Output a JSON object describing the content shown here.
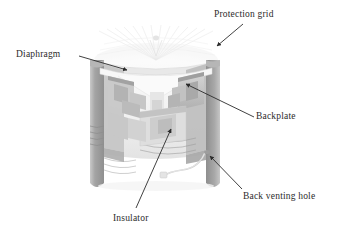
{
  "figure": {
    "kind": "cutaway-illustration",
    "background_color": "#ffffff",
    "line_color": "#2b2b2b",
    "body_gray_dark": "#9a9a9a",
    "body_gray_mid": "#bcbcbc",
    "body_gray_light": "#dcdcdc",
    "body_gray_pale": "#efefef"
  },
  "labels": {
    "protection_grid": "Protection grid",
    "diaphragm": "Diaphragm",
    "backplate": "Backplate",
    "back_venting_hole": "Back venting hole",
    "insulator": "Insulator"
  },
  "callouts": [
    {
      "name": "protection-grid",
      "label": "Protection grid",
      "text_x": 214,
      "text_y": 9,
      "line_from_x": 243,
      "line_from_y": 24,
      "arrow_x": 215,
      "arrow_y": 47
    },
    {
      "name": "diaphragm",
      "label": "Diaphragm",
      "text_x": 16,
      "text_y": 49,
      "line_from_x": 79,
      "line_from_y": 56,
      "arrow_x": 129,
      "arrow_y": 71
    },
    {
      "name": "backplate",
      "label": "Backplate",
      "text_x": 256,
      "text_y": 111,
      "line_from_x": 254,
      "line_from_y": 119,
      "arrow_x": 184,
      "arrow_y": 83
    },
    {
      "name": "back-venting-hole",
      "label": "Back venting hole",
      "text_x": 243,
      "text_y": 191,
      "line_from_x": 242,
      "line_from_y": 190,
      "arrow_x": 208,
      "arrow_y": 155
    },
    {
      "name": "insulator",
      "label": "Insulator",
      "text_x": 113,
      "text_y": 213,
      "line_from_x": 136,
      "line_from_y": 208,
      "arrow_x": 173,
      "arrow_y": 128
    }
  ]
}
